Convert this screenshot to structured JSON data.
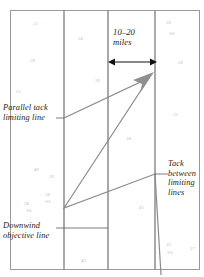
{
  "figure": {
    "title_visible": false,
    "background_color": "#ffffff",
    "border_color": "#9a9a9a"
  },
  "annotations": {
    "parallel_tack": "Parallel tack\nlimiting line",
    "tack_between": "Tack\nbetween\nlimiting\nlines",
    "downwind_objective": "Downwind\nobjective line",
    "distance": "10–20\nmiles"
  },
  "chart_data": {
    "type": "diagram",
    "xlabel": "",
    "ylabel": "",
    "grid": false,
    "legend": "none",
    "xlim": [
      0,
      204
    ],
    "ylim": [
      0,
      277
    ],
    "limiting_lines": [
      {
        "name": "left-limiting-line",
        "x": 64,
        "y0": 10,
        "y1": 270
      },
      {
        "name": "mid-left-line",
        "x": 108,
        "y0": 10,
        "y1": 270
      },
      {
        "name": "right-limiting-line",
        "x": 155,
        "y0": 10,
        "y1": 270
      }
    ],
    "track_path": [
      {
        "x": 64,
        "y": 118
      },
      {
        "x": 152,
        "y": 76
      },
      {
        "x": 64,
        "y": 208
      },
      {
        "x": 155,
        "y": 174
      },
      {
        "x": 160,
        "y": 274
      }
    ],
    "arrow_head": {
      "x": 152,
      "y": 76,
      "direction": "up-right",
      "color": "#8a8a8a"
    },
    "dimension_arrow": {
      "x0": 110,
      "x1": 155,
      "y": 62,
      "label": "10–20 miles"
    },
    "leader_lines": [
      {
        "from": "parallel-tack-label",
        "x0": 56,
        "x1": 64,
        "y": 118
      },
      {
        "from": "tack-between-label",
        "x0": 155,
        "x1": 168,
        "y": 174
      },
      {
        "from": "downwind-objective-label",
        "x0": 56,
        "x1": 108,
        "y": 228
      }
    ],
    "soundings": [
      {
        "value": "21",
        "x": 33,
        "y": 21
      },
      {
        "value": "24",
        "x": 78,
        "y": 36
      },
      {
        "value": "28",
        "x": 30,
        "y": 58
      },
      {
        "value": "30",
        "x": 95,
        "y": 78
      },
      {
        "value": "55",
        "x": 16,
        "y": 89
      },
      {
        "value": "36",
        "x": 166,
        "y": 20
      },
      {
        "value": "Wk",
        "x": 169,
        "y": 31
      },
      {
        "value": "30",
        "x": 178,
        "y": 60
      },
      {
        "value": "33",
        "x": 173,
        "y": 112
      },
      {
        "value": "34",
        "x": 126,
        "y": 136
      },
      {
        "value": "49",
        "x": 34,
        "y": 167
      },
      {
        "value": "39",
        "x": 49,
        "y": 174
      },
      {
        "value": "34",
        "x": 45,
        "y": 192
      },
      {
        "value": "Wk",
        "x": 45,
        "y": 199
      },
      {
        "value": "34",
        "x": 24,
        "y": 201
      },
      {
        "value": "Wk",
        "x": 26,
        "y": 208
      },
      {
        "value": "41",
        "x": 139,
        "y": 205
      },
      {
        "value": "33",
        "x": 166,
        "y": 242
      },
      {
        "value": "Wk",
        "x": 167,
        "y": 250
      },
      {
        "value": "27",
        "x": 190,
        "y": 246
      },
      {
        "value": "43",
        "x": 81,
        "y": 258
      }
    ]
  }
}
